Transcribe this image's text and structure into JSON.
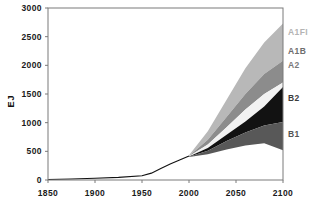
{
  "chart_data": {
    "type": "area",
    "title": "",
    "subtitle": "",
    "xlabel": "",
    "ylabel": "EJ",
    "xlim": [
      1850,
      2100
    ],
    "ylim": [
      0,
      3000
    ],
    "grid": false,
    "legend_position": "right-inline",
    "x_ticks": [
      "1850",
      "1900",
      "1950",
      "2000",
      "2050",
      "2100"
    ],
    "x_tick_values": [
      1850,
      1900,
      1950,
      2000,
      2050,
      2100
    ],
    "y_ticks": [
      "0",
      "500",
      "1000",
      "1500",
      "2000",
      "2500",
      "3000"
    ],
    "y_tick_values": [
      0,
      500,
      1000,
      1500,
      2000,
      2500,
      3000
    ],
    "historical": {
      "name": "Historical primary energy",
      "x": [
        1850,
        1875,
        1900,
        1925,
        1950,
        1960,
        1970,
        1980,
        1990,
        2000
      ],
      "values": [
        10,
        18,
        30,
        45,
        75,
        120,
        200,
        280,
        350,
        420
      ]
    },
    "series": [
      {
        "name": "A1FI",
        "color": "#b8b8b8",
        "x": [
          2000,
          2020,
          2040,
          2060,
          2080,
          2100
        ],
        "upper": [
          430,
          850,
          1400,
          1950,
          2400,
          2730
        ],
        "lower": [
          420,
          700,
          1100,
          1500,
          1850,
          2080
        ]
      },
      {
        "name": "A1B",
        "color": "#8c8c8c",
        "x": [
          2000,
          2020,
          2040,
          2060,
          2080,
          2100
        ],
        "upper": [
          420,
          700,
          1100,
          1500,
          1850,
          2080
        ],
        "lower": [
          415,
          620,
          920,
          1230,
          1500,
          1700
        ]
      },
      {
        "name": "A2",
        "color": "#f2f2f2",
        "x": [
          2000,
          2020,
          2040,
          2060,
          2080,
          2100
        ],
        "upper": [
          415,
          620,
          920,
          1230,
          1500,
          1700
        ],
        "lower": [
          410,
          560,
          790,
          1020,
          1280,
          1620
        ]
      },
      {
        "name": "B2",
        "color": "#121212",
        "x": [
          2000,
          2020,
          2040,
          2060,
          2080,
          2100
        ],
        "upper": [
          410,
          560,
          790,
          1020,
          1280,
          1620
        ],
        "lower": [
          405,
          510,
          680,
          830,
          950,
          1010
        ]
      },
      {
        "name": "B1",
        "color": "#585858",
        "x": [
          2000,
          2020,
          2040,
          2060,
          2080,
          2100
        ],
        "upper": [
          405,
          510,
          680,
          830,
          950,
          1010
        ],
        "lower": [
          400,
          450,
          530,
          600,
          640,
          520
        ]
      }
    ],
    "labels": [
      {
        "text": "A1FI",
        "value": 2580,
        "color": "#b4b4b4"
      },
      {
        "text": "A1B",
        "value": 2250,
        "color": "#6e6e6e"
      },
      {
        "text": "A2",
        "value": 2000,
        "color": "#7a7a7a"
      },
      {
        "text": "B2",
        "value": 1430,
        "color": "#3c3c3c"
      },
      {
        "text": "B1",
        "value": 800,
        "color": "#555555"
      }
    ]
  },
  "axis": {
    "y_title": "EJ"
  }
}
